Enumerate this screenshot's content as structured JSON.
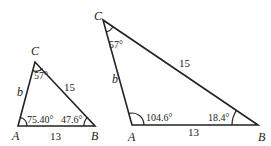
{
  "triangles": [
    {
      "id": "small",
      "vertices": {
        "A": "A",
        "B": "B",
        "C": "C"
      },
      "sides": {
        "b": "b",
        "a": "15",
        "c": "13"
      },
      "angles": {
        "A": "75.40°",
        "B": "47.6°",
        "C": "57°"
      }
    },
    {
      "id": "large",
      "vertices": {
        "A": "A",
        "B": "B",
        "C": "C"
      },
      "sides": {
        "b": "b",
        "a": "15",
        "c": "13"
      },
      "angles": {
        "A": "104.6°",
        "B": "18.4°",
        "C": "57°"
      }
    }
  ]
}
